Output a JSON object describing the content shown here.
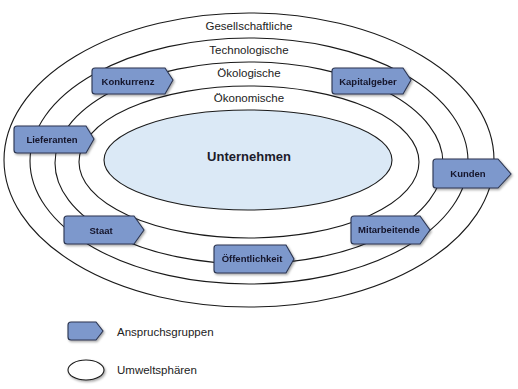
{
  "diagram": {
    "center": {
      "label": "Unternehmen",
      "fill": "#dbe9f6"
    },
    "spheres": [
      {
        "label": "Gesellschaftliche"
      },
      {
        "label": "Technologische"
      },
      {
        "label": "Ökologische"
      },
      {
        "label": "Ökonomische"
      }
    ],
    "stakeholders": [
      {
        "label": "Konkurrenz"
      },
      {
        "label": "Kapitalgeber"
      },
      {
        "label": "Lieferanten"
      },
      {
        "label": "Kunden"
      },
      {
        "label": "Staat"
      },
      {
        "label": "Mitarbeitende"
      },
      {
        "label": "Öffentlichkeit"
      }
    ],
    "stakeholder_fill": "#7d98cc"
  },
  "legend": {
    "items": [
      {
        "label": "Anspruchsgruppen",
        "symbol": "tag-shape"
      },
      {
        "label": "Umweltsphären",
        "symbol": "ellipse"
      }
    ]
  }
}
